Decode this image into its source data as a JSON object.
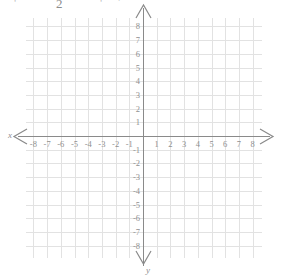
{
  "figure": {
    "type": "coordinate-grid",
    "background_color": "#ffffff",
    "grid_color": "#e2e2e2",
    "axis_color": "#8a8a8a",
    "label_color": "#8f8f8f",
    "width": 287,
    "height": 278
  },
  "top_artifacts": [
    {
      "text": "2",
      "left": 56,
      "top": -2,
      "strong": true
    },
    {
      "text": "'",
      "left": 14,
      "top": -3,
      "strong": false
    },
    {
      "text": "'",
      "left": 100,
      "top": -3,
      "strong": false
    },
    {
      "text": "'",
      "left": 118,
      "top": -4,
      "strong": false
    }
  ],
  "axes": {
    "x_label": "x",
    "y_label": "y",
    "x_label_position": {
      "left": 8,
      "top": 131
    },
    "y_label_position": {
      "left": 146,
      "top": 266
    },
    "arrows": [
      "left",
      "right",
      "up",
      "down"
    ]
  },
  "chart_data": {
    "type": "scatter",
    "title": "",
    "xlabel": "x",
    "ylabel": "y",
    "xlim": [
      -8.5,
      8.5
    ],
    "ylim": [
      -8.5,
      8.5
    ],
    "grid": true,
    "legend": null,
    "series": [],
    "x_ticks": [
      -8,
      -7,
      -6,
      -5,
      -4,
      -3,
      -2,
      -1,
      1,
      2,
      3,
      4,
      5,
      6,
      7,
      8
    ],
    "y_ticks": [
      8,
      7,
      6,
      5,
      4,
      3,
      2,
      1,
      -1,
      -2,
      -3,
      -4,
      -5,
      -6,
      -7,
      -8
    ],
    "x_tick_labels": [
      "-8",
      "-7",
      "-6",
      "-5",
      "-4",
      "-3",
      "-2",
      "-1",
      "1",
      "2",
      "3",
      "4",
      "5",
      "6",
      "7",
      "8"
    ],
    "y_tick_labels": [
      "8",
      "7",
      "6",
      "5",
      "4",
      "3",
      "2",
      "1",
      "-1",
      "-2",
      "-3",
      "-4",
      "-5",
      "-6",
      "-7",
      "-8"
    ],
    "origin_px": {
      "x": 143,
      "y": 136
    },
    "cell_px": 13.7
  }
}
